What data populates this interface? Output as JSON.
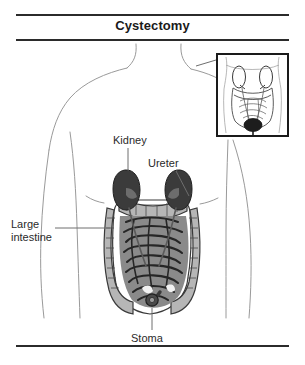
{
  "figure": {
    "title": "Cystectomy",
    "type": "medical-anatomical-illustration",
    "rules": {
      "top": true,
      "under_title": true,
      "bottom": true
    }
  },
  "labels": [
    {
      "id": "kidney",
      "text": "Kidney"
    },
    {
      "id": "ureter",
      "text": "Ureter"
    },
    {
      "id": "large-intestine",
      "text": "Large\nintestine"
    },
    {
      "id": "stoma",
      "text": "Stoma"
    }
  ],
  "inset": {
    "present": true,
    "description": "Smaller line drawing of the abdomen before surgery, with the bladder shown as a dark filled oval at the base of the pelvis."
  },
  "colors": {
    "ink": "#1a1a1a",
    "rule": "#2b2b2b",
    "body_outline": "#9a9a9a",
    "kidney_fill": "#3b3b3b",
    "kidney_shadow": "#2a2a2a",
    "colon_fill": "#b6b6b6",
    "colon_outline": "#3a3a3a",
    "small_intestine_fill": "#8a8a8a",
    "small_intestine_outline": "#262626",
    "stoma_fill": "#4a4a4a",
    "bladder_fill": "#1d1d1d",
    "leader_line": "#6e6e6e",
    "background": "#ffffff"
  }
}
